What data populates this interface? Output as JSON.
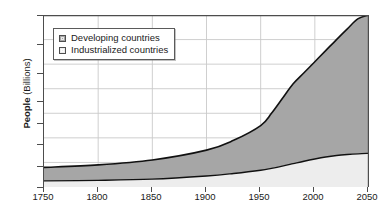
{
  "chart_data": {
    "type": "area",
    "title": "",
    "subtitle": "",
    "xlabel": "",
    "ylabel": "People (Billions)",
    "ylabel_bold_part": "People",
    "ylabel_plain_part": " (Billions)",
    "grid": true,
    "legend_position": "top-left-inside",
    "stacked": true,
    "xlim": [
      1750,
      2050
    ],
    "ylim": [
      0,
      10
    ],
    "yticks": [
      0,
      1,
      2,
      3,
      4,
      6,
      8,
      10
    ],
    "ytick_labels": [
      "0",
      "1",
      "2",
      "3",
      "4",
      "6",
      "8",
      "10"
    ],
    "y_axis_note": "non-uniform / compressed scale: equal pixel spacing between 0,1,2,3,4 then between 4,6,8,10",
    "xticks": [
      1750,
      1800,
      1850,
      1900,
      1950,
      2000,
      2050
    ],
    "xtick_labels": [
      "1750",
      "1800",
      "1850",
      "1900",
      "1950",
      "2000",
      "2050"
    ],
    "x": [
      1750,
      1800,
      1850,
      1900,
      1925,
      1950,
      1960,
      1970,
      1980,
      1990,
      2000,
      2010,
      2020,
      2030,
      2040,
      2050
    ],
    "series": [
      {
        "name": "Industrialized countries",
        "color": "#ededed",
        "values": [
          0.25,
          0.27,
          0.32,
          0.45,
          0.55,
          0.68,
          0.76,
          0.85,
          0.95,
          1.05,
          1.14,
          1.22,
          1.28,
          1.32,
          1.35,
          1.37
        ]
      },
      {
        "name": "Developing countries",
        "color": "#a6a6a6",
        "values": [
          0.55,
          0.63,
          0.78,
          1.05,
          1.35,
          1.82,
          2.24,
          2.75,
          3.45,
          4.25,
          5.06,
          5.88,
          6.72,
          7.55,
          8.35,
          8.63
        ]
      }
    ],
    "total_values": [
      0.8,
      0.9,
      1.1,
      1.5,
      1.9,
      2.5,
      3.0,
      3.6,
      4.4,
      5.3,
      6.2,
      7.1,
      8.0,
      8.87,
      9.7,
      10.0
    ],
    "annotations": []
  },
  "legend": {
    "items": [
      {
        "label": "Developing countries",
        "swatch": "dark-gray-swatch"
      },
      {
        "label": "Industrialized countries",
        "swatch": "light-gray-swatch"
      }
    ]
  },
  "colors": {
    "developing_fill": "#a6a6a6",
    "industrialized_fill": "#ededed",
    "curve_line": "#111111",
    "axis": "#4d4d4d",
    "gridline": "#c9c9c9",
    "text": "#1a1a1a",
    "background": "#ffffff"
  }
}
